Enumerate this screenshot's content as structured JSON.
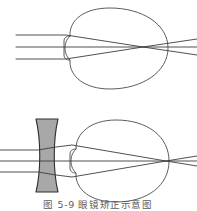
{
  "figure": {
    "caption": "图 5-9  眼镜矫正示意图",
    "caption_index": "图 5-9",
    "caption_title": "眼镜矫正示意图",
    "background_color": "#ffffff",
    "stroke_color": "#3c3c3c",
    "outline_color": "#4a4a4a",
    "lens_fill_color": "#a8a8a8",
    "lens_stroke_color": "#2e2e2e",
    "caption_color": "#5c5c5c",
    "width": 197,
    "height": 211
  },
  "panels": [
    {
      "id": "panel-uncorrected",
      "label": "近视眼",
      "description": "Uncorrected myopic eye: parallel rays converge in front of the retina",
      "has_lens": false,
      "ray_count": 3,
      "focus_position": "in-front-of-retina",
      "eye": {
        "center_x": 118,
        "center_y": 48,
        "radius_x": 50,
        "radius_y": 42,
        "cornea_side": "left"
      },
      "rays": [
        {
          "id": "ray-top",
          "entry_y": 35
        },
        {
          "id": "ray-middle",
          "entry_y": 47
        },
        {
          "id": "ray-bottom",
          "entry_y": 59
        }
      ],
      "focal_point": {
        "x": 143,
        "y": 47
      }
    },
    {
      "id": "panel-corrected",
      "label": "凹透镜矫正",
      "description": "Corrected myopic eye: a biconcave spectacle lens diverges the rays so they focus on the retina",
      "has_lens": true,
      "ray_count": 3,
      "focus_position": "on-retina",
      "lens": {
        "type": "biconcave",
        "fill": "#a8a8a8",
        "center_x": 47,
        "top_y": 119,
        "bottom_y": 192,
        "edge_half_width": 11,
        "waist_half_width": 4.5
      },
      "eye": {
        "center_x": 122,
        "center_y": 161,
        "radius_x": 47,
        "radius_y": 41,
        "cornea_side": "left"
      },
      "rays": [
        {
          "id": "ray-top",
          "entry_y": 150
        },
        {
          "id": "ray-middle",
          "entry_y": 161
        },
        {
          "id": "ray-bottom",
          "entry_y": 172
        }
      ],
      "focal_point": {
        "x": 166,
        "y": 161
      }
    }
  ]
}
